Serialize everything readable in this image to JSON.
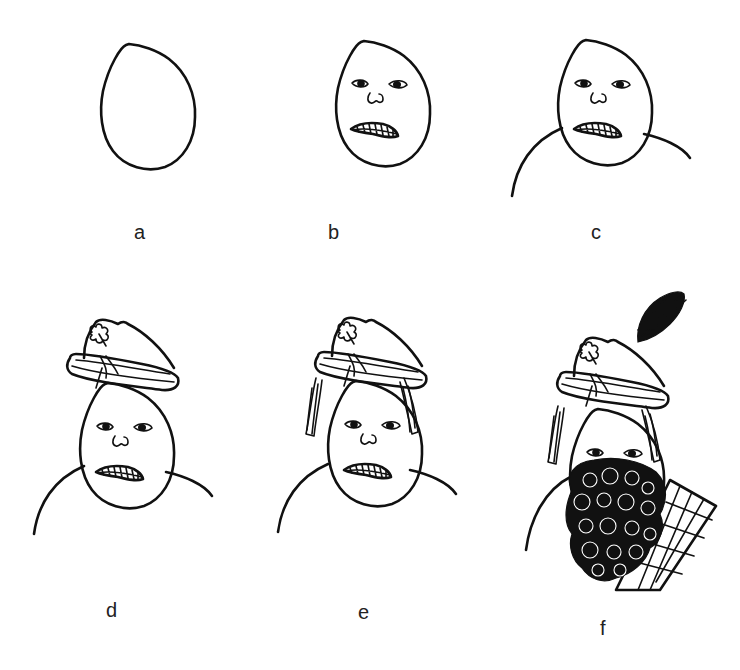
{
  "figure": {
    "steps": [
      {
        "label": "a",
        "description": "Egg-shaped head outline"
      },
      {
        "label": "b",
        "description": "Eyes, nose and teeth-baring mouth added"
      },
      {
        "label": "c",
        "description": "Shoulders added"
      },
      {
        "label": "d",
        "description": "Cap with shamrock badge added"
      },
      {
        "label": "e",
        "description": "Hair on sides added"
      },
      {
        "label": "f",
        "description": "Feather plume, curly beard and tartan sash added"
      }
    ]
  },
  "colors": {
    "ink": "#111111",
    "background": "#ffffff",
    "label": "#222222"
  }
}
